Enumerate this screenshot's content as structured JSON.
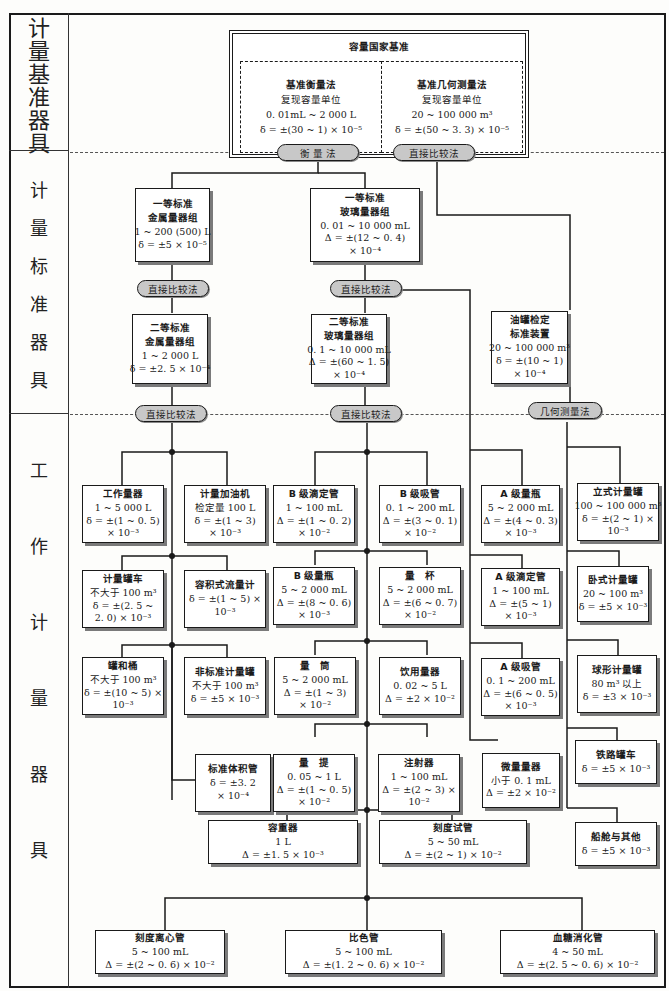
{
  "side_sections": [
    {
      "label": "计量基准器具",
      "chars": [
        "计",
        "量",
        "基",
        "准",
        "器",
        "具"
      ]
    },
    {
      "label": "计量标准器具",
      "chars": [
        "计",
        "量",
        "标",
        "准",
        "器",
        "具"
      ]
    },
    {
      "label": "工作计量器具",
      "chars": [
        "工",
        "作",
        "计",
        "量",
        "器",
        "具"
      ]
    }
  ],
  "national_standard": {
    "title": "容量国家基准",
    "left": {
      "title": "基准衡量法",
      "lines": [
        "复现容量单位",
        "0. 01mL ~ 2 000 L",
        "δ = ±(30 ~ 1) × 10⁻⁵"
      ]
    },
    "right": {
      "title": "基准几何测量法",
      "lines": [
        "复现容量单位",
        "20 ~ 100 000 m³",
        "δ = ±(50 ~ 3. 3) × 10⁻⁵"
      ]
    }
  },
  "methods": {
    "weighing": "衡 量 法",
    "direct_compare_top": "直接比较法",
    "direct_compare_metal1": "直接比较法",
    "direct_compare_glass1": "直接比较法",
    "direct_compare_metal2": "直接比较法",
    "direct_compare_glass2": "直接比较法",
    "geometric": "几何测量法"
  },
  "standard_instruments": [
    {
      "id": "metal1",
      "title": "一等标准",
      "lines": [
        "金属量器组",
        "1 ~ 200 (500) L",
        "δ = ±5 × 10⁻⁵"
      ]
    },
    {
      "id": "glass1",
      "title": "一等标准",
      "lines": [
        "玻璃量器组",
        "0. 01 ~ 10 000 mL",
        "Δ = ±(12 ~ 0. 4)",
        "× 10⁻⁴"
      ]
    },
    {
      "id": "metal2",
      "title": "二等标准",
      "lines": [
        "金属量器组",
        "1 ~ 2 000  L",
        "δ = ±2. 5 × 10⁻⁴"
      ]
    },
    {
      "id": "glass2",
      "title": "二等标准",
      "lines": [
        "玻璃量器组",
        "0. 1 ~ 10 000 mL",
        "Δ = ±(60 ~ 1. 5)",
        "× 10⁻⁴"
      ]
    },
    {
      "id": "tank",
      "title": "油罐检定",
      "lines": [
        "标准装置",
        "20 ~ 100 000 m³",
        "δ = ±(10 ~ 1)",
        "× 10⁻⁴"
      ]
    }
  ],
  "working_instruments": [
    {
      "id": "w1",
      "title": "工作量器",
      "lines": [
        "1 ~ 5 000  L",
        "δ = ±(1 ~ 0. 5)",
        "× 10⁻³"
      ]
    },
    {
      "id": "w2",
      "title": "计量加油机",
      "lines": [
        "检定量 100 L",
        "δ = ±(1 ~ 3)",
        "× 10⁻³"
      ]
    },
    {
      "id": "w3",
      "title": "计量罐车",
      "lines": [
        "不大于 100 m³",
        "δ = ±(2. 5 ~",
        "2. 0) × 10⁻³"
      ]
    },
    {
      "id": "w4",
      "title": "容积式流量计",
      "lines": [
        "δ = ±(1 ~ 5) ×",
        "10⁻³"
      ]
    },
    {
      "id": "w5",
      "title": "罐和桶",
      "lines": [
        "不大于 100 m³",
        "δ = ±(10 ~ 5) ×",
        "10⁻³"
      ]
    },
    {
      "id": "w6",
      "title": "非标准计量罐",
      "lines": [
        "不大于 100 m³",
        "δ = ±5 × 10⁻³"
      ]
    },
    {
      "id": "w7",
      "title": "标准体积管",
      "lines": [
        "δ = ±3. 2",
        "× 10⁻⁴"
      ]
    },
    {
      "id": "g1",
      "title": "B 级滴定管",
      "lines": [
        "1 ~ 100  mL",
        "Δ = ±(1 ~ 0. 2)",
        "× 10⁻²"
      ]
    },
    {
      "id": "g2",
      "title": "B 级吸管",
      "lines": [
        "0. 1 ~ 200  mL",
        "Δ = ±(3 ~ 0. 1)",
        "× 10⁻²"
      ]
    },
    {
      "id": "g3",
      "title": "B 级量瓶",
      "lines": [
        "5 ~ 2 000 mL",
        "Δ = ±(8 ~ 0. 6)",
        "× 10⁻³"
      ]
    },
    {
      "id": "g4",
      "title": "量　杯",
      "lines": [
        "5 ~ 2 000 mL",
        "Δ = ±(6 ~ 0. 7)",
        "× 10⁻²"
      ]
    },
    {
      "id": "g5",
      "title": "量　筒",
      "lines": [
        "5 ~ 2 000  mL",
        "Δ = ±(1 ~ 3)",
        "× 10⁻²"
      ]
    },
    {
      "id": "g6",
      "title": "饮用量器",
      "lines": [
        "0. 02 ~ 5  L",
        "Δ = ±2 × 10⁻²"
      ]
    },
    {
      "id": "g7",
      "title": "量　提",
      "lines": [
        "0. 05 ~ 1 L",
        "Δ = ±(1 ~ 0. 5)",
        "× 10⁻²"
      ]
    },
    {
      "id": "g8",
      "title": "注射器",
      "lines": [
        "1 ~ 100  mL",
        "Δ = ±(2 ~ 3) ×",
        "10⁻²"
      ]
    },
    {
      "id": "a1",
      "title": "A 级量瓶",
      "lines": [
        "5 ~ 2 000  mL",
        "Δ = ±(4 ~ 0. 3)",
        "× 10⁻³"
      ]
    },
    {
      "id": "a2",
      "title": "A 级滴定管",
      "lines": [
        "1 ~ 100 mL",
        "Δ = ±(5 ~ 1)",
        "× 10⁻³"
      ]
    },
    {
      "id": "a3",
      "title": "A 级吸管",
      "lines": [
        "0. 1 ~ 200  mL",
        "Δ = ±(6 ~ 0. 5)",
        "× 10⁻³"
      ]
    },
    {
      "id": "a4",
      "title": "微量量器",
      "lines": [
        "小于 0. 1 mL",
        "Δ = ±2 × 10⁻²"
      ]
    },
    {
      "id": "t1",
      "title": "立式计量罐",
      "lines": [
        "100 ~ 100 000 m³",
        "δ = ±(2 ~ 1) ×",
        "10⁻³"
      ]
    },
    {
      "id": "t2",
      "title": "卧式计量罐",
      "lines": [
        "20 ~ 100 m³",
        "δ = ±5 × 10⁻³"
      ]
    },
    {
      "id": "t3",
      "title": "球形计量罐",
      "lines": [
        "80 m³ 以上",
        "δ = ±3 × 10⁻³"
      ]
    },
    {
      "id": "t4",
      "title": "铁路罐车",
      "lines": [
        "δ = ±5 × 10⁻³"
      ]
    },
    {
      "id": "t5",
      "title": "船舱与其他",
      "lines": [
        "δ = ±5 × 10⁻³"
      ]
    },
    {
      "id": "c1",
      "title": "容重器",
      "lines": [
        "1 L",
        "Δ = ±1. 5 × 10⁻³"
      ]
    },
    {
      "id": "c2",
      "title": "刻度试管",
      "lines": [
        "5 ~ 50  mL",
        "Δ = ±(2 ~ 1) × 10⁻²"
      ]
    },
    {
      "id": "b1",
      "title": "刻度离心管",
      "lines": [
        "5 ~ 100 mL",
        "Δ = ±(2 ~ 0. 6) × 10⁻²"
      ]
    },
    {
      "id": "b2",
      "title": "比色管",
      "lines": [
        "5 ~ 100  mL",
        "Δ = ±(1. 2 ~ 0. 6) × 10⁻²"
      ]
    },
    {
      "id": "b3",
      "title": "血糖消化管",
      "lines": [
        "4 ~ 50  mL",
        "Δ = ±(2. 5 ~ 0. 6) × 10⁻²"
      ]
    }
  ]
}
